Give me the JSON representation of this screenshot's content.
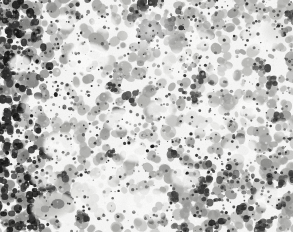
{
  "image": {
    "kind": "micrograph",
    "modality": "brightfield-light-microscopy",
    "specimen_label": "bone-marrow-smear",
    "stain": "grayscale",
    "caption": "",
    "width_px": 303,
    "height_px": 241,
    "content_width_px": 293,
    "content_height_px": 232,
    "margin_color": "#ffffff",
    "background_color": "#f7f7f6"
  },
  "palette": {
    "background": "#f7f7f6",
    "white_space": "#fefefe",
    "pale_gray": "#d8d8d6",
    "light_gray": "#c0c0be",
    "mid_gray": "#9a9a98",
    "dark_gray": "#6e6e6c",
    "darker_gray": "#4a4a49",
    "near_black": "#262625",
    "black": "#101010",
    "halo_gray": "#e6e6e4"
  },
  "features": {
    "dense_cell_field": "confluent hematopoietic cells across entire field",
    "dark_cluster_top_center": "dark aggregate with pale halo near top center",
    "pale_large_cell_bottom_left": "large pale cell with gray cytoplasm lower left",
    "white_lacunae": "irregular white interstitial spaces",
    "dark_zone_left": "high-contrast dark cell clusters along left edge",
    "grain": "fine photographic grain / film noise"
  },
  "noise": {
    "speckle_count": 2400,
    "cell_count": 1350,
    "cluster_count": 120
  }
}
